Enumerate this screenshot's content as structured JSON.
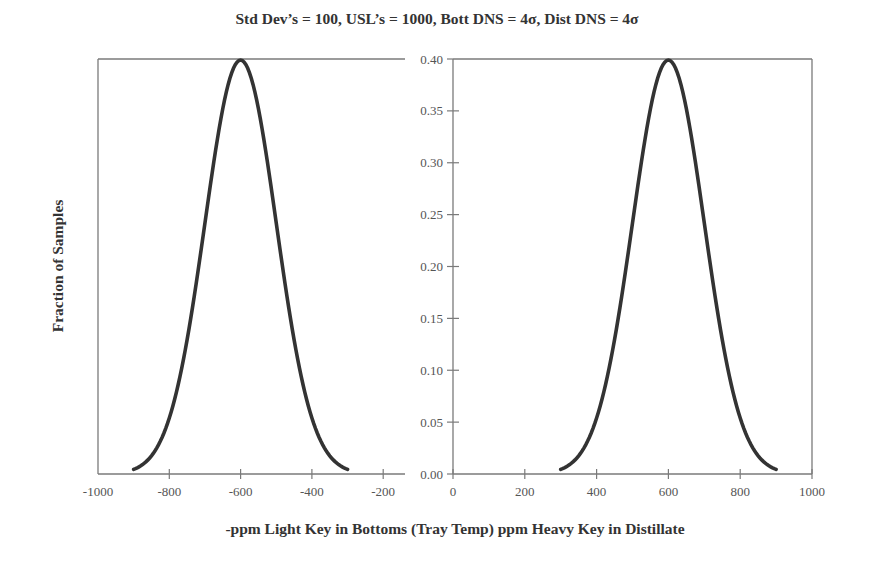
{
  "chart_data": {
    "type": "line",
    "title": "Std Dev’s = 100, USL’s = 1000, Bott DNS = 4σ, Dist DNS = 4σ",
    "ylabel": "Fraction of Samples",
    "xlabel": "-ppm Light Key in Bottoms (Tray Temp) ppm Heavy Key in Distillate",
    "ylim": [
      0.0,
      0.4
    ],
    "grid": false,
    "legend": null,
    "yticks": [
      "0.40",
      "0.35",
      "0.30",
      "0.25",
      "0.20",
      "0.15",
      "0.10",
      "0.05",
      "0.00"
    ],
    "panels": [
      {
        "name": "Bottoms",
        "xlim": [
          -1000,
          -150
        ],
        "xticks": [
          "-1000",
          "-800",
          "-600",
          "-400",
          "-200"
        ],
        "xtick_values": [
          -1000,
          -800,
          -600,
          -400,
          -200
        ],
        "series": [
          {
            "name": "Bottoms distribution",
            "distribution": "normal",
            "mean": -600,
            "std_dev": 100,
            "x_range": [
              -900,
              -300
            ],
            "x": [
              -900,
              -850,
              -800,
              -750,
              -700,
              -650,
              -600,
              -550,
              -500,
              -450,
              -400,
              -350,
              -300
            ],
            "y": [
              0.0044,
              0.0175,
              0.054,
              0.1295,
              0.242,
              0.3521,
              0.3989,
              0.3521,
              0.242,
              0.1295,
              0.054,
              0.0175,
              0.0044
            ]
          }
        ]
      },
      {
        "name": "Distillate",
        "xlim": [
          0,
          1000
        ],
        "xticks": [
          "0",
          "200",
          "400",
          "600",
          "800",
          "1000"
        ],
        "xtick_values": [
          0,
          200,
          400,
          600,
          800,
          1000
        ],
        "series": [
          {
            "name": "Distillate distribution",
            "distribution": "normal",
            "mean": 600,
            "std_dev": 100,
            "x_range": [
              300,
              900
            ],
            "x": [
              300,
              350,
              400,
              450,
              500,
              550,
              600,
              650,
              700,
              750,
              800,
              850,
              900
            ],
            "y": [
              0.0044,
              0.0175,
              0.054,
              0.1295,
              0.242,
              0.3521,
              0.3989,
              0.3521,
              0.242,
              0.1295,
              0.054,
              0.0175,
              0.0044
            ]
          }
        ]
      }
    ]
  },
  "colors": {
    "curve": "#333333",
    "axis": "#7a7a7a",
    "text": "#444444"
  }
}
